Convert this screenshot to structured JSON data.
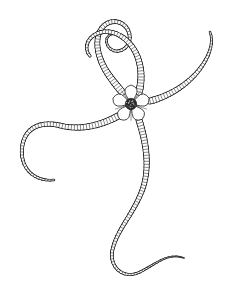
{
  "figure": {
    "title": "Brittle star (Ophiuroidea) line illustration",
    "style": "ink line drawing, black on white",
    "background_color": "#ffffff",
    "ink_color": "#1a1a1a",
    "canvas": {
      "width": 249,
      "height": 305
    },
    "disc": {
      "label": "central disc",
      "center": {
        "x": 131,
        "y": 104
      },
      "radius": 19,
      "arm_count": 5,
      "plate_shape": "five-petal star rosette",
      "center_texture": "dark granulated mouth plate",
      "center_color": "#2b2b2b"
    },
    "arms": [
      {
        "name": "arm-upper-left",
        "label": "Upper-left arm with terminal spiral coil",
        "tip_feature": "tight inward spiral",
        "direction": "up-left",
        "path": "M 122 92 C 112 80 104 70 100 58 C 95 44 97 30 106 24 C 114 19 124 22 128 30 C 132 38 129 47 122 50 C 116 53 109 50 107 44 C 105 39 108 34 113 34",
        "width_start": 7.5,
        "width_end": 2.2
      },
      {
        "name": "arm-upper-right",
        "label": "Upper-right arm arching over the disc",
        "tip_feature": "small hook",
        "direction": "up-right",
        "path": "M 139 92 C 143 76 141 60 133 48 C 124 34 108 28 96 34 C 86 39 84 50 90 56",
        "width_start": 7.5,
        "width_end": 3.0
      },
      {
        "name": "arm-right",
        "label": "Right arm with two stacked loops",
        "tip_feature": "recurved hook tip",
        "direction": "right",
        "path": "M 150 101 C 170 96 188 84 199 70 C 210 56 214 42 210 32",
        "width_start": 7.0,
        "width_end": 2.4
      },
      {
        "name": "arm-lower-right",
        "label": "Long lower arm sweeping down and right to a fine tip",
        "tip_feature": "tapered filament",
        "direction": "down-right",
        "path": "M 139 120 C 146 142 150 166 143 188 C 134 214 116 230 112 252 C 110 268 124 280 140 272 C 156 264 168 252 184 258",
        "width_start": 7.0,
        "width_end": 1.6
      },
      {
        "name": "arm-lower-left",
        "label": "Lower-left arm with bulbous loops",
        "tip_feature": "blunt looped end",
        "direction": "down-left",
        "path": "M 118 116 C 100 126 80 130 62 126 C 40 120 24 128 22 148 C 20 168 34 182 54 180",
        "width_start": 7.2,
        "width_end": 2.4
      }
    ],
    "texture": {
      "segments_label": "vertebral segment rungs",
      "rung_spacing_px": 3.0,
      "rung_color": "#2a2a2a"
    }
  }
}
